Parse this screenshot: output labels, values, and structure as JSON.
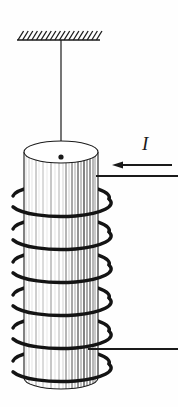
{
  "figure": {
    "background_color": "#fefefe",
    "ink_color": "#1a1a1a",
    "width": 178,
    "height": 407
  },
  "ceiling": {
    "name": "hatched ceiling support",
    "line_y": 40,
    "line_x_start": 17,
    "line_x_end": 100,
    "hatch_count": 18,
    "hatch_length": 9,
    "hatch_lean": "up-right",
    "stroke_color": "#1a1a1a",
    "stroke_width": 1.6
  },
  "suspension_wire": {
    "name": "suspension wire",
    "x": 61,
    "y_top": 40,
    "y_bottom": 157,
    "stroke_color": "#1a1a1a",
    "stroke_width": 1.2
  },
  "attachment_point": {
    "name": "wire attachment dot",
    "cx": 61,
    "cy": 157,
    "r": 2.6,
    "fill": "#1a1a1a"
  },
  "cylinder": {
    "name": "solenoid core cylinder",
    "center_x": 61,
    "rx": 37,
    "ry": 11,
    "top_y": 152,
    "bottom_y": 378,
    "outline_color": "#1a1a1a",
    "outline_width": 1.1,
    "face_fill": "#ffffff",
    "shading_stripes": [
      {
        "offset": -35,
        "width": 0.8,
        "color": "#cfcfcf"
      },
      {
        "offset": -32,
        "width": 0.8,
        "color": "#bdbdbd"
      },
      {
        "offset": -29,
        "width": 0.7,
        "color": "#d8d8d8"
      },
      {
        "offset": -25,
        "width": 1.0,
        "color": "#9e9e9e"
      },
      {
        "offset": -22,
        "width": 0.7,
        "color": "#dedede"
      },
      {
        "offset": -18,
        "width": 0.9,
        "color": "#b0b0b0"
      },
      {
        "offset": -14,
        "width": 0.7,
        "color": "#e0e0e0"
      },
      {
        "offset": -10,
        "width": 1.0,
        "color": "#8f8f8f"
      },
      {
        "offset": -6,
        "width": 0.7,
        "color": "#d5d5d5"
      },
      {
        "offset": -2,
        "width": 0.9,
        "color": "#a8a8a8"
      },
      {
        "offset": 2,
        "width": 0.8,
        "color": "#c8c8c8"
      },
      {
        "offset": 5,
        "width": 1.1,
        "color": "#7a7a7a"
      },
      {
        "offset": 8,
        "width": 0.8,
        "color": "#bfbfbf"
      },
      {
        "offset": 11,
        "width": 1.2,
        "color": "#6e6e6e"
      },
      {
        "offset": 14,
        "width": 0.9,
        "color": "#9a9a9a"
      },
      {
        "offset": 17,
        "width": 1.3,
        "color": "#5c5c5c"
      },
      {
        "offset": 20,
        "width": 1.0,
        "color": "#8a8a8a"
      },
      {
        "offset": 23,
        "width": 1.4,
        "color": "#4f4f4f"
      },
      {
        "offset": 26,
        "width": 1.1,
        "color": "#6a6a6a"
      },
      {
        "offset": 29,
        "width": 1.2,
        "color": "#5a5a5a"
      },
      {
        "offset": 32,
        "width": 1.0,
        "color": "#707070"
      },
      {
        "offset": 34,
        "width": 0.9,
        "color": "#8a8a8a"
      }
    ]
  },
  "coil": {
    "name": "solenoid winding",
    "turn_count": 6,
    "center_x": 61,
    "rx": 48,
    "ry": 13,
    "first_turn_y": 196,
    "turn_spacing": 33,
    "stroke_color": "#141414",
    "stroke_width": 3.4
  },
  "leads": {
    "top_lead": {
      "name": "top lead wire",
      "y": 176,
      "x_start": 96,
      "x_end": 178,
      "stroke_width": 2.2
    },
    "bottom_lead": {
      "name": "bottom lead wire",
      "y": 349,
      "x_start": 88,
      "x_end": 178,
      "stroke_width": 2.2
    }
  },
  "current_arrow": {
    "name": "current direction arrow",
    "y": 165,
    "tail_x": 172,
    "head_x": 112,
    "head_width": 11,
    "head_height": 7,
    "stroke_width": 1.8,
    "color": "#1a1a1a",
    "direction": "left"
  },
  "current_label": {
    "text": "I",
    "left": 142,
    "top": 134,
    "font_size_px": 19,
    "style": "italic serif"
  }
}
